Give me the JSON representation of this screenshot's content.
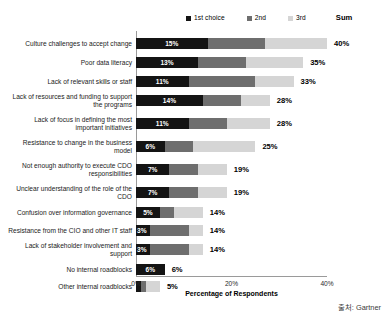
{
  "legend": {
    "entries": [
      {
        "label": "1st choice",
        "color": "#141414",
        "icon": "square-swatch-icon"
      },
      {
        "label": "2nd",
        "color": "#6e6e6e",
        "icon": "square-swatch-icon"
      },
      {
        "label": "3rd",
        "color": "#d5d5d5",
        "icon": "square-swatch-icon"
      }
    ],
    "sum_label": "Sum"
  },
  "axis": {
    "xticks": [
      "0%",
      "20%",
      "40%"
    ],
    "xtick_values": [
      0,
      20,
      40
    ],
    "xlabel": "Percentage of Respondents",
    "xmin": 0,
    "xmax": 40
  },
  "source": "출처: Gartner",
  "chart_data": {
    "type": "bar",
    "title": "",
    "subtitle": "",
    "xlabel": "Percentage of Respondents",
    "ylabel": "",
    "xlim": [
      0,
      40
    ],
    "grid": false,
    "orientation": "horizontal",
    "stacked": true,
    "legend_position": "top-right",
    "categories": [
      "Culture challenges to accept change",
      "Poor data literacy",
      "Lack of relevant skills or staff",
      "Lack of resources and funding to support the programs",
      "Lack of focus in defining the most important initiatives",
      "Resistance to change in the business model",
      "Not enough authority to execute CDO responsibilities",
      "Unclear understanding of the role of the CDO",
      "Confusion over information governance",
      "Resistance from the CIO and other IT staff",
      "Lack of stakeholder involvement and support",
      "No internal roadblocks",
      "Other internal roadblocks"
    ],
    "series": [
      {
        "name": "1st choice",
        "color": "#141414",
        "values": [
          15,
          13,
          11,
          14,
          11,
          6,
          7,
          7,
          5,
          3,
          3,
          6,
          1
        ]
      },
      {
        "name": "2nd",
        "color": "#6e6e6e",
        "values": [
          12,
          10,
          14,
          8,
          8,
          6,
          6,
          6,
          3,
          8,
          8,
          0,
          1
        ]
      },
      {
        "name": "3rd",
        "color": "#d5d5d5",
        "values": [
          13,
          12,
          8,
          6,
          9,
          13,
          6,
          6,
          6,
          3,
          3,
          0,
          3
        ]
      }
    ],
    "sums": [
      40,
      35,
      33,
      28,
      28,
      25,
      19,
      19,
      14,
      14,
      14,
      6,
      5
    ],
    "sum_display": [
      "40%",
      "35%",
      "33%",
      "28%",
      "28%",
      "25%",
      "19%",
      "19%",
      "14%",
      "14%",
      "14%",
      "6%",
      "5%"
    ],
    "first_choice_display": [
      "15%",
      "13%",
      "11%",
      "14%",
      "11%",
      "6%",
      "7%",
      "7%",
      "5%",
      "3%",
      "3%",
      "6%",
      ""
    ]
  }
}
